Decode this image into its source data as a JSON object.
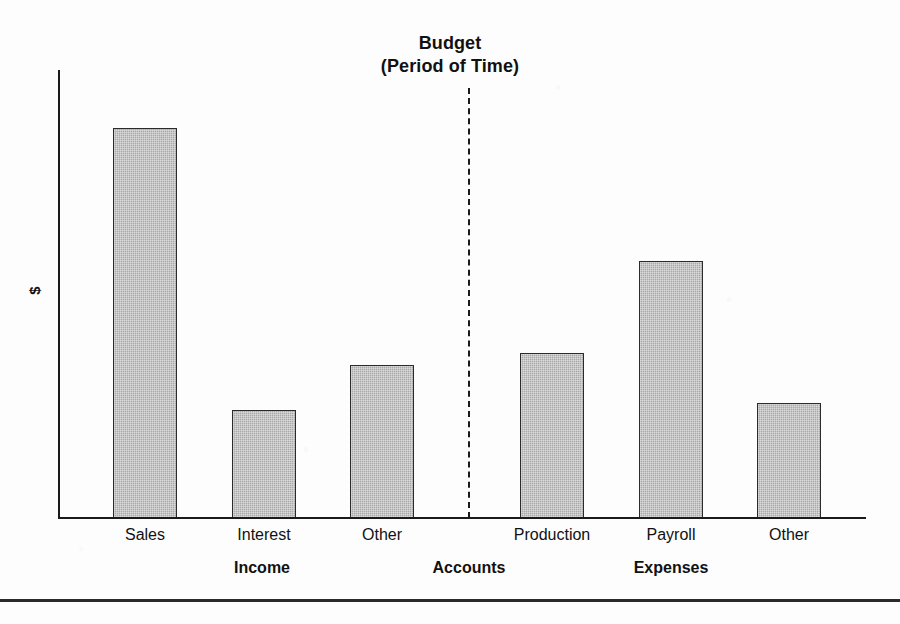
{
  "chart_data": {
    "type": "bar",
    "title": "Budget",
    "subtitle": "(Period of Time)",
    "xlabel": "Accounts",
    "ylabel": "$",
    "grid": false,
    "legend": "none",
    "ylim": [
      0,
      100
    ],
    "categories": [
      "Sales",
      "Interest",
      "Other",
      "Production",
      "Payroll",
      "Other"
    ],
    "values": [
      86,
      24,
      34,
      36,
      57,
      25
    ],
    "groups": [
      {
        "label": "Income",
        "categories": [
          "Sales",
          "Interest",
          "Other"
        ],
        "values": [
          86,
          24,
          34
        ]
      },
      {
        "label": "Expenses",
        "categories": [
          "Production",
          "Payroll",
          "Other"
        ],
        "values": [
          36,
          57,
          25
        ]
      }
    ],
    "annotations": [
      "dashed vertical divider separating Income from Expenses"
    ],
    "bar_color": "#a9a9a9",
    "bar_edge_color": "#2b2b2b",
    "axis_color": "#1a1a1a"
  },
  "title": {
    "line1": "Budget",
    "line2": "(Period of Time)"
  },
  "axes": {
    "y_label": "$",
    "center_group_label": "Accounts"
  },
  "bars": [
    {
      "name": "sales",
      "label": "Sales",
      "value": 86,
      "x": 113,
      "width": 64,
      "top": 128
    },
    {
      "name": "interest",
      "label": "Interest",
      "value": 24,
      "x": 232,
      "width": 64,
      "top": 410
    },
    {
      "name": "other-income",
      "label": "Other",
      "value": 34,
      "x": 350,
      "width": 64,
      "top": 365
    },
    {
      "name": "production",
      "label": "Production",
      "value": 36,
      "x": 520,
      "width": 64,
      "top": 353
    },
    {
      "name": "payroll",
      "label": "Payroll",
      "value": 57,
      "x": 639,
      "width": 64,
      "top": 261
    },
    {
      "name": "other-expense",
      "label": "Other",
      "value": 25,
      "x": 757,
      "width": 64,
      "top": 403
    }
  ],
  "groups": [
    {
      "name": "income",
      "label": "Income",
      "center": 262
    },
    {
      "name": "accounts",
      "label": "Accounts",
      "center": 469
    },
    {
      "name": "expenses",
      "label": "Expenses",
      "center": 671
    }
  ]
}
